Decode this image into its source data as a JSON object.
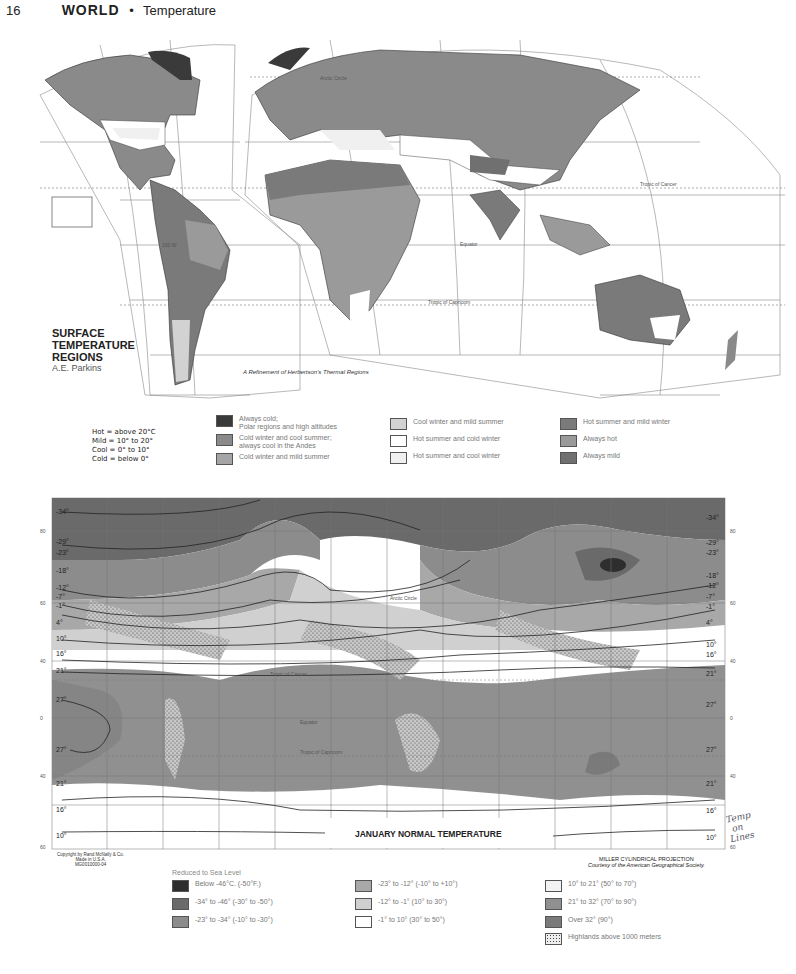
{
  "header": {
    "page_number": "16",
    "section": "WORLD",
    "separator": "•",
    "topic": "Temperature"
  },
  "surface_map": {
    "title_lines": [
      "SURFACE",
      "TEMPERATURE",
      "REGIONS"
    ],
    "author": "A.E. Parkins",
    "subcaption": "A Refinement of Herbertson's Thermal Regions",
    "labels": {
      "arctic_circle": "Arctic Circle",
      "tropic_cancer": "Tropic of Cancer",
      "equator": "Equator",
      "tropic_capricorn": "Tropic of Capricorn",
      "lon_100w": "100 W"
    },
    "key_lines": [
      "Hot = above 20°C",
      "Mild = 10° to 20°",
      "Cool = 0° to 10°",
      "Cold = below 0°"
    ],
    "legend": [
      {
        "label": "Always cold;\nPolar regions and high altitudes",
        "color": "#3a3a3a"
      },
      {
        "label": "Cold winter and cool summer;\nalways cool in the Andes",
        "color": "#8a8a8a"
      },
      {
        "label": "Cold winter and mild summer",
        "color": "#a5a5a5"
      },
      {
        "label": "Cool winter and mild summer",
        "color": "#d2d2d2"
      },
      {
        "label": "Hot summer and cold winter",
        "color": "#ffffff"
      },
      {
        "label": "Hot summer and cool winter",
        "color": "#f0f0f0"
      },
      {
        "label": "Hot summer and mild winter",
        "color": "#7a7a7a"
      },
      {
        "label": "Always hot",
        "color": "#9a9a9a"
      },
      {
        "label": "Always mild",
        "color": "#707070"
      }
    ]
  },
  "january_map": {
    "title": "JANUARY NORMAL TEMPERATURE",
    "projection": "MILLER CYLINDRICAL PROJECTION",
    "courtesy": "Courtesy of the American Geographical Society.",
    "copyright_lines": [
      "Copyright by Rand McNally & Co.",
      "Made in U.S.A.",
      "MG0010000-04"
    ],
    "isotherms_left": [
      "-34°",
      "-29°",
      "-23°",
      "-18°",
      "-12°",
      "-7°",
      "-1°",
      "4°",
      "10°",
      "16°",
      "21°",
      "27°",
      "27°",
      "21°",
      "16°",
      "10°"
    ],
    "isotherms_right": [
      "-34°",
      "-29°",
      "-23°",
      "-18°",
      "-12°",
      "-7°",
      "-1°",
      "4°",
      "10°",
      "16°",
      "21°",
      "27°",
      "27°",
      "21°",
      "16°",
      "10°"
    ],
    "lat_ticks": [
      "80",
      "60",
      "40",
      "20",
      "0",
      "20",
      "40",
      "60"
    ],
    "lon_ticks": [
      "160",
      "140",
      "120",
      "100",
      "80",
      "60",
      "40",
      "20",
      "0",
      "20",
      "40",
      "60",
      "80",
      "100",
      "120",
      "140",
      "160",
      "180"
    ],
    "legend_heading": "Reduced to Sea Level",
    "legend": [
      {
        "label": "Below -46°C. (-50°F.)",
        "color": "#2e2e2e"
      },
      {
        "label": "-34° to -46° (-30° to -50°)",
        "color": "#6a6a6a"
      },
      {
        "label": "-23° to -34° (-10° to -30°)",
        "color": "#8c8c8c"
      },
      {
        "label": "-23° to -12° (-10° to +10°)",
        "color": "#a8a8a8"
      },
      {
        "label": "-12° to -1° (10° to 30°)",
        "color": "#d0d0d0"
      },
      {
        "label": "-1° to 10° (30° to 50°)",
        "color": "#ffffff"
      },
      {
        "label": "10° to 21° (50° to 70°)",
        "color": "#f2f2f2"
      },
      {
        "label": "21° to 32° (70° to 90°)",
        "color": "#909090"
      },
      {
        "label": "Over 32° (90°)",
        "color": "#7a7a7a"
      },
      {
        "label": "Highlands above 1000 meters",
        "color": "dotted"
      }
    ]
  },
  "handwriting": [
    "Temp",
    "on",
    "Lines"
  ]
}
